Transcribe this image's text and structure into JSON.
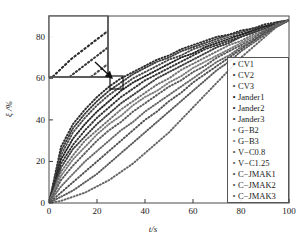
{
  "chart_data": {
    "type": "line",
    "title": "",
    "xlabel": "t/s",
    "ylabel": "ξ /%",
    "xlim": [
      0,
      100
    ],
    "ylim": [
      0,
      90
    ],
    "xticks": [
      0,
      20,
      40,
      60,
      80,
      100
    ],
    "yticks": [
      0,
      20,
      40,
      60,
      80
    ],
    "grid": false,
    "legend_position": "right-middle",
    "marker_style": "dotted",
    "x": [
      0,
      5,
      10,
      15,
      20,
      25,
      30,
      35,
      40,
      45,
      50,
      55,
      60,
      65,
      70,
      75,
      80,
      85,
      90,
      95,
      100
    ],
    "series": [
      {
        "name": "CV1",
        "color": "#2b2b2b",
        "values": [
          0,
          27,
          38,
          45,
          51,
          56,
          60,
          63,
          66,
          69,
          71,
          74,
          76,
          78,
          80,
          81,
          83,
          84,
          86,
          87,
          88
        ]
      },
      {
        "name": "CV2",
        "color": "#3a3a3a",
        "values": [
          0,
          25,
          36,
          43,
          49,
          54,
          58,
          62,
          65,
          68,
          70,
          73,
          75,
          77,
          79,
          81,
          82,
          84,
          85,
          87,
          88
        ]
      },
      {
        "name": "CV3",
        "color": "#4a4a4a",
        "values": [
          0,
          23,
          34,
          41,
          47,
          52,
          56,
          60,
          63,
          66,
          69,
          71,
          74,
          76,
          78,
          80,
          81,
          83,
          85,
          86,
          88
        ]
      },
      {
        "name": "Jander1",
        "color": "#222222",
        "values": [
          0,
          21,
          31,
          38,
          44,
          49,
          54,
          58,
          61,
          64,
          67,
          70,
          72,
          75,
          77,
          79,
          81,
          83,
          85,
          86,
          88
        ]
      },
      {
        "name": "Jander2",
        "color": "#303030",
        "values": [
          0,
          19,
          28,
          35,
          41,
          46,
          51,
          55,
          59,
          62,
          65,
          68,
          71,
          74,
          76,
          78,
          80,
          82,
          84,
          86,
          88
        ]
      },
      {
        "name": "Jander3",
        "color": "#3c3c3c",
        "values": [
          0,
          17,
          26,
          32,
          38,
          43,
          48,
          52,
          56,
          60,
          63,
          66,
          69,
          72,
          75,
          77,
          80,
          82,
          84,
          86,
          88
        ]
      },
      {
        "name": "G−B2",
        "color": "#707070",
        "values": [
          0,
          15,
          23,
          30,
          35,
          40,
          45,
          49,
          53,
          57,
          60,
          64,
          67,
          70,
          73,
          76,
          78,
          81,
          83,
          86,
          88
        ]
      },
      {
        "name": "G−B3",
        "color": "#7d7d7d",
        "values": [
          0,
          13,
          21,
          27,
          33,
          38,
          42,
          47,
          51,
          54,
          58,
          61,
          65,
          68,
          71,
          74,
          77,
          80,
          83,
          85,
          88
        ]
      },
      {
        "name": "V−C0.8",
        "color": "#5a5a5a",
        "values": [
          0,
          11,
          18,
          24,
          30,
          35,
          39,
          44,
          48,
          52,
          56,
          59,
          63,
          66,
          70,
          73,
          76,
          79,
          83,
          85,
          88
        ]
      },
      {
        "name": "V−C1.25",
        "color": "#666666",
        "values": [
          0,
          8,
          14,
          20,
          25,
          30,
          35,
          39,
          44,
          48,
          52,
          56,
          60,
          64,
          68,
          71,
          75,
          78,
          82,
          85,
          88
        ]
      },
      {
        "name": "C−JMAK1",
        "color": "#4f4f4f",
        "values": [
          0,
          5,
          10,
          15,
          20,
          25,
          30,
          35,
          40,
          44,
          49,
          53,
          58,
          62,
          66,
          70,
          74,
          78,
          82,
          85,
          88
        ]
      },
      {
        "name": "C−JMAK2",
        "color": "#595959",
        "values": [
          0,
          3,
          6,
          10,
          14,
          19,
          24,
          29,
          34,
          39,
          44,
          49,
          54,
          59,
          64,
          68,
          73,
          77,
          81,
          85,
          88
        ]
      },
      {
        "name": "C−JMAK3",
        "color": "#636363",
        "values": [
          0,
          1,
          3,
          5,
          8,
          11,
          15,
          19,
          24,
          29,
          34,
          40,
          46,
          52,
          58,
          64,
          70,
          75,
          80,
          85,
          88
        ]
      }
    ],
    "inset": {
      "label": "magnified-region",
      "source_box": {
        "x": 26,
        "y": 57,
        "w": 5,
        "h": 5
      },
      "arrow": "points-from-inset-to-source-box"
    }
  },
  "legend": {
    "items": [
      {
        "label": "CV1"
      },
      {
        "label": "CV2"
      },
      {
        "label": "CV3"
      },
      {
        "label": "Jander1"
      },
      {
        "label": "Jander2"
      },
      {
        "label": "Jander3"
      },
      {
        "label": "G−B2"
      },
      {
        "label": "G−B3"
      },
      {
        "label": "V−C0.8"
      },
      {
        "label": "V−C1.25"
      },
      {
        "label": "C−JMAK1"
      },
      {
        "label": "C−JMAK2"
      },
      {
        "label": "C−JMAK3"
      }
    ],
    "marker_glyph": "•"
  },
  "axes": {
    "xlabel": "t/s",
    "ylabel": "ξ /%",
    "xticks": [
      "0",
      "20",
      "40",
      "60",
      "80",
      "100"
    ],
    "yticks": [
      "0",
      "20",
      "40",
      "60",
      "80"
    ]
  }
}
